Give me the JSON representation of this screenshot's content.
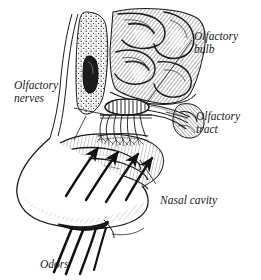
{
  "figure": {
    "background_color": "#ffffff",
    "ink_color": "#1a1a1a",
    "style": "engraved pen-and-ink line art with hatching and stippling"
  },
  "labels": {
    "olfactory_bulb": {
      "line1": "Olfactory",
      "line2": "bulb"
    },
    "olfactory_nerves": {
      "line1": "Olfactory",
      "line2": "nerves"
    },
    "olfactory_tract": {
      "line1": "Olfactory",
      "line2": "tract"
    },
    "nasal_cavity": {
      "line1": "Nasal cavity"
    },
    "odors": {
      "line1": "Odors"
    }
  },
  "structures": [
    {
      "name": "cerebral-cortex",
      "description": "convoluted frontal lobe gyri with dense hatching"
    },
    {
      "name": "olfactory-bulb",
      "description": "oval bulb resting on cribriform plate"
    },
    {
      "name": "olfactory-tract",
      "description": "band running posteriorly from the bulb"
    },
    {
      "name": "cribriform-plate",
      "description": "perforated bone between bulb and nasal cavity"
    },
    {
      "name": "olfactory-nerve-fibers",
      "description": "filaments passing through cribriform plate"
    },
    {
      "name": "spongy-bone",
      "description": "stippled porous skull bone anterior to cavity"
    },
    {
      "name": "frontal-sinus",
      "description": "dark elongated air cavity in the bone"
    },
    {
      "name": "nasal-conchae",
      "description": "scroll-shaped turbinates in nasal cavity"
    },
    {
      "name": "nose-profile",
      "description": "external nose outline with tip and nostril"
    },
    {
      "name": "airflow-arrows",
      "description": "four arrows curving up through nasal cavity"
    },
    {
      "name": "odor-streamlines",
      "description": "four strokes entering the nostril from below"
    }
  ]
}
